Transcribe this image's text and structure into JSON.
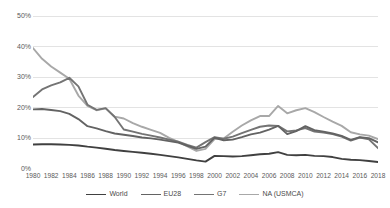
{
  "chart_data": {
    "type": "line",
    "title": "",
    "subtitle": "",
    "xlabel": "",
    "ylabel": "",
    "grid": true,
    "legend_position": "bottom",
    "xlim": [
      1980,
      2018
    ],
    "ylim": [
      0,
      50
    ],
    "ytick_values": [
      0,
      10,
      20,
      30,
      40,
      50
    ],
    "ytick_labels": [
      "0%",
      "10%",
      "20%",
      "30%",
      "40%",
      "50%"
    ],
    "x": [
      1980,
      1981,
      1982,
      1983,
      1984,
      1985,
      1986,
      1987,
      1988,
      1989,
      1990,
      1991,
      1992,
      1993,
      1994,
      1995,
      1996,
      1997,
      1998,
      1999,
      2000,
      2001,
      2002,
      2003,
      2004,
      2005,
      2006,
      2007,
      2008,
      2009,
      2010,
      2011,
      2012,
      2013,
      2014,
      2015,
      2016,
      2017,
      2018
    ],
    "xtick_labels": [
      "1980",
      "1982",
      "1984",
      "1986",
      "1988",
      "1990",
      "1992",
      "1994",
      "1996",
      "1998",
      "2000",
      "2002",
      "2004",
      "2006",
      "2008",
      "2010",
      "2012",
      "2014",
      "2016",
      "2018"
    ],
    "series": [
      {
        "name": "World",
        "color": "#404040",
        "width": 1.9,
        "values": [
          8.0,
          8.1,
          8.1,
          8.0,
          7.9,
          7.7,
          7.3,
          7.0,
          6.6,
          6.2,
          5.9,
          5.6,
          5.3,
          5.0,
          4.6,
          4.2,
          3.8,
          3.3,
          2.8,
          2.4,
          4.3,
          4.2,
          4.1,
          4.2,
          4.5,
          4.8,
          5.0,
          5.5,
          4.6,
          4.5,
          4.6,
          4.3,
          4.2,
          3.9,
          3.3,
          3.0,
          2.9,
          2.6,
          2.3
        ]
      },
      {
        "name": "EU28",
        "color": "#636363",
        "width": 1.9,
        "values": [
          19.5,
          19.6,
          19.3,
          18.9,
          18.0,
          16.3,
          14.0,
          13.3,
          12.4,
          11.6,
          11.2,
          10.8,
          10.3,
          10.0,
          9.6,
          9.1,
          8.6,
          7.6,
          6.6,
          7.3,
          10.2,
          9.4,
          9.6,
          10.4,
          11.3,
          11.9,
          12.9,
          14.1,
          11.4,
          12.4,
          14.0,
          12.7,
          12.2,
          11.6,
          10.8,
          9.5,
          10.4,
          10.1,
          8.7
        ]
      },
      {
        "name": "G7",
        "color": "#747474",
        "width": 1.9,
        "values": [
          23.5,
          26.0,
          27.3,
          28.3,
          29.8,
          27.0,
          21.0,
          19.3,
          19.9,
          17.0,
          12.9,
          12.2,
          11.5,
          10.9,
          10.3,
          9.6,
          8.9,
          7.9,
          7.0,
          8.8,
          10.4,
          9.9,
          10.6,
          11.7,
          12.8,
          13.8,
          14.2,
          14.1,
          12.3,
          12.6,
          13.4,
          12.2,
          11.9,
          11.4,
          10.6,
          9.3,
          10.3,
          9.7,
          6.8
        ]
      },
      {
        "name": "NA (USMCA)",
        "color": "#a8a8a8",
        "width": 1.9,
        "values": [
          39.5,
          36.0,
          33.5,
          31.5,
          29.5,
          24.0,
          20.6,
          19.2,
          19.8,
          17.1,
          16.5,
          15.0,
          13.8,
          12.8,
          11.8,
          10.2,
          8.9,
          7.4,
          5.9,
          6.6,
          9.8,
          10.0,
          12.2,
          14.2,
          15.9,
          17.3,
          17.3,
          20.6,
          18.2,
          19.2,
          19.9,
          18.6,
          17.0,
          15.5,
          14.1,
          12.0,
          11.3,
          10.9,
          9.8
        ]
      }
    ]
  },
  "legend": {
    "items": [
      {
        "label": "World",
        "color": "#404040"
      },
      {
        "label": "EU28",
        "color": "#636363"
      },
      {
        "label": "G7",
        "color": "#747474"
      },
      {
        "label": "NA (USMCA)",
        "color": "#a8a8a8"
      }
    ]
  },
  "style": {
    "gridline_color": "#e3e3e3",
    "tick_text_color": "#5a5a5a",
    "background": "#ffffff"
  }
}
